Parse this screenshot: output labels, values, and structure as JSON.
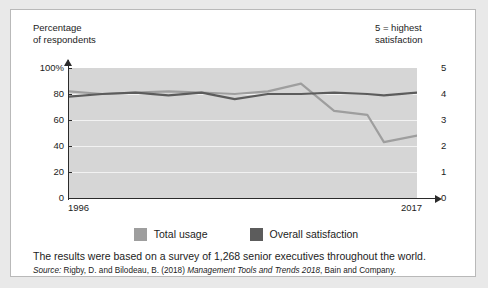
{
  "card": {
    "left_axis_title": "Percentage\nof respondents",
    "right_axis_title": "5 = highest\nsatisfaction",
    "note": "The results were based on a survey of 1,268 senior executives throughout the world.",
    "source": {
      "label": "Source:",
      "authors": " Rigby, D. and Bilodeau, B. (2018) ",
      "title": "Management Tools and Trends 2018",
      "publisher": ", Bain and Company."
    }
  },
  "legend": {
    "items": [
      {
        "label": "Total usage",
        "color": "#9e9e9e",
        "swatch_name": "legend-swatch-total-usage"
      },
      {
        "label": "Overall satisfaction",
        "color": "#5c5c5c",
        "swatch_name": "legend-swatch-overall-satisfaction"
      }
    ]
  },
  "chart_data": {
    "type": "line",
    "title": "",
    "xlabel": "",
    "ylabel": "Percentage of respondents",
    "y2label": "5 = highest satisfaction",
    "grid": true,
    "legend_position": "bottom-center",
    "plot_background": "#d6d6d6",
    "gridline_color": "#f2f2f2",
    "x": [
      1996,
      1998,
      2000,
      2002,
      2004,
      2006,
      2008,
      2010,
      2012,
      2014,
      2015,
      2017
    ],
    "xtick_labels": [
      "1996",
      "2017"
    ],
    "xlim": [
      1996,
      2017
    ],
    "ylim": [
      0,
      100
    ],
    "ytick_labels": [
      "100%",
      "80",
      "60",
      "40",
      "20",
      "0"
    ],
    "ytick_values": [
      100,
      80,
      60,
      40,
      20,
      0
    ],
    "y2lim": [
      0,
      5
    ],
    "y2tick_labels": [
      "5",
      "4",
      "3",
      "2",
      "1",
      "0"
    ],
    "y2tick_values": [
      5,
      4,
      3,
      2,
      1,
      0
    ],
    "series": [
      {
        "name": "Total usage",
        "color": "#9e9e9e",
        "axis": "left",
        "unit": "%",
        "values": [
          82,
          80,
          81,
          82,
          81,
          80,
          82,
          88,
          67,
          64,
          43,
          48
        ]
      },
      {
        "name": "Overall satisfaction",
        "color": "#5c5c5c",
        "axis": "right",
        "unit": "rating",
        "values": [
          3.9,
          4.0,
          4.05,
          3.95,
          4.05,
          3.8,
          4.0,
          4.0,
          4.05,
          4.0,
          3.95,
          4.05
        ]
      }
    ]
  }
}
